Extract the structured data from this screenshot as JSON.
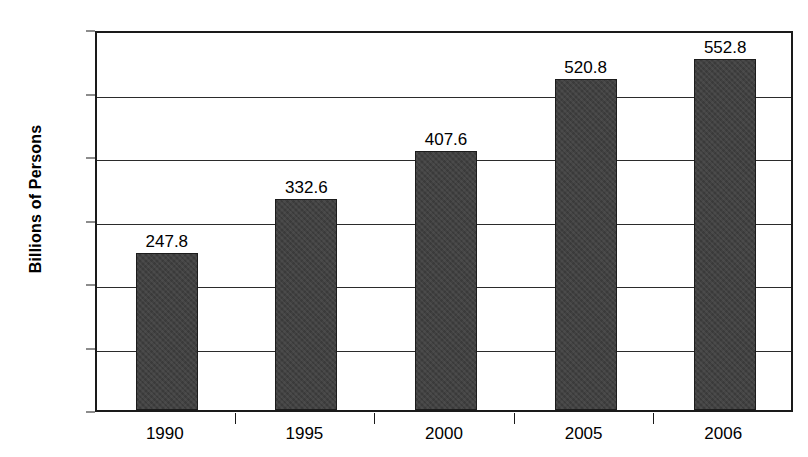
{
  "chart_data": {
    "type": "bar",
    "title": "",
    "xlabel": "",
    "ylabel": "Billions of Persons",
    "categories": [
      "1990",
      "1995",
      "2000",
      "2005",
      "2006"
    ],
    "values": [
      247.8,
      332.6,
      407.6,
      520.8,
      552.8
    ],
    "value_labels": [
      "247.8",
      "332.6",
      "407.6",
      "520.8",
      "552.8"
    ],
    "ylim": [
      0,
      600
    ],
    "ytick_labels": [
      "600",
      "500",
      "400",
      "300",
      "200",
      "100",
      "0"
    ],
    "ytick_values": [
      600,
      500,
      400,
      300,
      200,
      100,
      0
    ],
    "grid": true,
    "legend": false,
    "bar_color": "#414141",
    "axis_color": "#1a1a1a",
    "background_color": "#ffffff"
  }
}
